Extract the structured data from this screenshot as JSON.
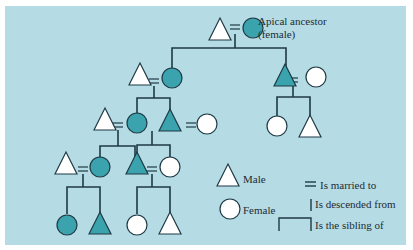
{
  "colors": {
    "background": "#b5dbe5",
    "affiliated_fill": "#3aa3ad",
    "unaffiliated_fill": "#ffffff",
    "stroke": "#1f3a44"
  },
  "diagram": {
    "title_annotation": "Apical ancestor",
    "title_annotation_sub": "(female)",
    "legend": {
      "male": "Male",
      "female": "Female",
      "married": "Is married to",
      "descended": "Is descended from",
      "sibling": "Is the sibling of",
      "married_symbol": "="
    },
    "generations": [
      {
        "level": 1,
        "members": [
          "male",
          "female-filled (apical ancestor)"
        ]
      },
      {
        "level": 2,
        "members": [
          "male",
          "female-filled",
          "male-filled",
          "female"
        ]
      },
      {
        "level": 3,
        "members": [
          "male",
          "female-filled",
          "male-filled",
          "female",
          "female",
          "male"
        ]
      },
      {
        "level": 4,
        "members": [
          "male",
          "female-filled",
          "male-filled",
          "female"
        ]
      },
      {
        "level": 5,
        "members": [
          "female-filled",
          "male-filled",
          "female",
          "male"
        ]
      }
    ]
  }
}
